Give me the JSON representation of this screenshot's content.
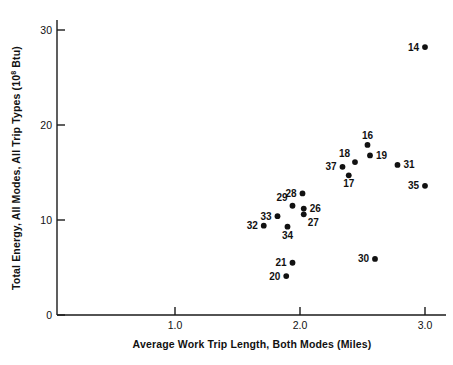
{
  "chart_data": {
    "type": "scatter",
    "title": "",
    "xlabel": "Average Work Trip Length, Both Modes (Miles)",
    "ylabel_parts": {
      "main": "Total Energy, All Modes, All Trip Types (10",
      "exponent": "8",
      "tail": " Btu)"
    },
    "ylabel": "Total Energy, All Modes, All Trip Types (10^8 Btu)",
    "xlim": [
      0.54,
      3.17
    ],
    "ylim": [
      0,
      31.6
    ],
    "xticks": [
      1.0,
      2.0,
      3.0
    ],
    "xtick_labels": [
      "1.0",
      "2.0",
      "3.0"
    ],
    "yticks": [
      0,
      10,
      20,
      30
    ],
    "ytick_labels": [
      "0",
      "10",
      "20",
      "30"
    ],
    "grid": false,
    "legend": "none",
    "marker_color": "#111111",
    "axis_color": "#1a1a1a",
    "points": [
      {
        "label": "14",
        "x": 3.0,
        "y": 28.2,
        "label_side": "left"
      },
      {
        "label": "16",
        "x": 2.54,
        "y": 17.9,
        "label_side": "top"
      },
      {
        "label": "19",
        "x": 2.56,
        "y": 16.8,
        "label_side": "right"
      },
      {
        "label": "18",
        "x": 2.44,
        "y": 16.1,
        "label_side": "topleft"
      },
      {
        "label": "37",
        "x": 2.34,
        "y": 15.6,
        "label_side": "left"
      },
      {
        "label": "31",
        "x": 2.78,
        "y": 15.8,
        "label_side": "right"
      },
      {
        "label": "17",
        "x": 2.39,
        "y": 14.7,
        "label_side": "bottom"
      },
      {
        "label": "35",
        "x": 3.0,
        "y": 13.6,
        "label_side": "left"
      },
      {
        "label": "28",
        "x": 2.02,
        "y": 12.8,
        "label_side": "left"
      },
      {
        "label": "26",
        "x": 2.03,
        "y": 11.2,
        "label_side": "right"
      },
      {
        "label": "29",
        "x": 1.94,
        "y": 11.5,
        "label_side": "topleft"
      },
      {
        "label": "27",
        "x": 2.03,
        "y": 10.6,
        "label_side": "bottomright"
      },
      {
        "label": "33",
        "x": 1.82,
        "y": 10.4,
        "label_side": "left"
      },
      {
        "label": "32",
        "x": 1.71,
        "y": 9.4,
        "label_side": "left"
      },
      {
        "label": "34",
        "x": 1.9,
        "y": 9.3,
        "label_side": "bottom"
      },
      {
        "label": "30",
        "x": 2.6,
        "y": 5.9,
        "label_side": "left"
      },
      {
        "label": "21",
        "x": 1.94,
        "y": 5.5,
        "label_side": "left"
      },
      {
        "label": "20",
        "x": 1.89,
        "y": 4.1,
        "label_side": "left"
      }
    ]
  },
  "figure": {
    "width": 453,
    "height": 365,
    "background": "#ffffff"
  }
}
